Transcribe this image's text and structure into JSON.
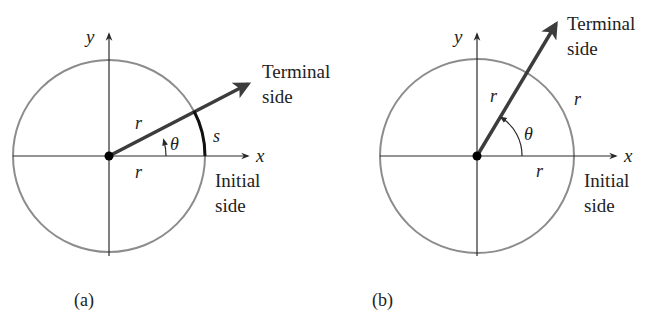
{
  "figures": [
    {
      "id": "a",
      "caption": "(a)",
      "axis_labels": {
        "x": "x",
        "y": "y"
      },
      "angle_label": "θ",
      "radius_label_terminal": "r",
      "radius_label_initial": "r",
      "arc_label": "s",
      "terminal_label_line1": "Terminal",
      "terminal_label_line2": "side",
      "initial_label_line1": "Initial",
      "initial_label_line2": "side"
    },
    {
      "id": "b",
      "caption": "(b)",
      "axis_labels": {
        "x": "x",
        "y": "y"
      },
      "angle_label": "θ",
      "radius_label_terminal": "r",
      "radius_label_initial": "r",
      "arc_label": "r",
      "terminal_label_line1": "Terminal",
      "terminal_label_line2": "side",
      "initial_label_line1": "Initial",
      "initial_label_line2": "side"
    }
  ],
  "colors": {
    "circle": "#8c8c8c",
    "axes": "#2a2a2a",
    "terminal_ray": "#3c3c3c",
    "arc_highlight": "#111111",
    "text": "#222222"
  }
}
